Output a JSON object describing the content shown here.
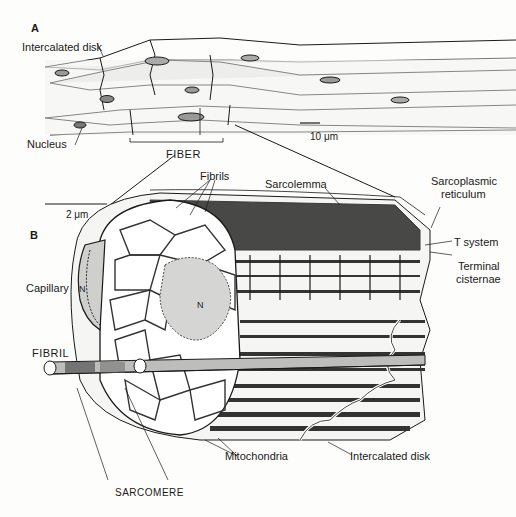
{
  "panel_a": {
    "letter": "A",
    "labels": {
      "intercalated_disk": "Intercalated disk",
      "nucleus": "Nucleus",
      "fiber": "FIBER",
      "scale_bar": "10 μm"
    }
  },
  "panel_b": {
    "letter": "B",
    "labels": {
      "scale_bar": "2 μm",
      "fibrils": "Fibrils",
      "sarcolemma": "Sarcolemma",
      "sarcoplasmic_reticulum_line1": "Sarcoplasmic",
      "sarcoplasmic_reticulum_line2": "reticulum",
      "t_system": "T system",
      "terminal_cisternae_line1": "Terminal",
      "terminal_cisternae_line2": "cisternae",
      "capillary": "Capillary",
      "nucleus_marker": "N",
      "fibril": "FIBRIL",
      "mitochondria": "Mitochondria",
      "intercalated_disk": "Intercalated disk",
      "sarcomere": "SARCOMERE"
    }
  },
  "colors": {
    "ink": "#1a1a1a",
    "paper": "#fdfdfb",
    "shade": "#8a8a8a"
  }
}
